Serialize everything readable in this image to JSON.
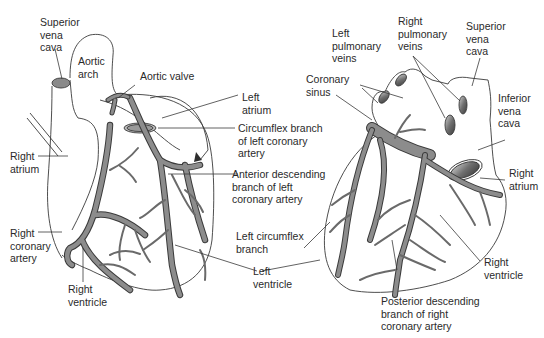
{
  "colors": {
    "vessel_fill": "#8c8c8c",
    "vessel_stroke": "#3a3a3a",
    "outline": "#3a3a3a",
    "leader": "#3a3a3a",
    "text": "#2a2a2a",
    "background": "#ffffff"
  },
  "anterior_view": {
    "labels": {
      "superior_vena_cava": "Superior\nvena\ncava",
      "aortic_arch": "Aortic\narch",
      "aortic_valve": "Aortic valve",
      "left_atrium": "Left\natrium",
      "circumflex_branch": "Circumflex branch\nof left coronary\nartery",
      "anterior_descending": "Anterior descending\nbranch of left\ncoronary artery",
      "right_atrium": "Right\natrium",
      "right_coronary_artery": "Right\ncoronary\nartery",
      "right_ventricle": "Right\nventricle",
      "left_circumflex_branch": "Left circumflex\nbranch",
      "left_ventricle": "Left\nventricle"
    }
  },
  "posterior_view": {
    "labels": {
      "left_pulmonary_veins": "Left\npulmonary\nveins",
      "right_pulmonary_veins": "Right\npulmonary\nveins",
      "superior_vena_cava": "Superior\nvena\ncava",
      "coronary_sinus": "Coronary\nsinus",
      "inferior_vena_cava": "Inferior\nvena\ncava",
      "right_atrium": "Right\natrium",
      "right_ventricle": "Right\nventricle",
      "posterior_descending": "Posterior descending\nbranch of right\ncoronary artery"
    }
  }
}
